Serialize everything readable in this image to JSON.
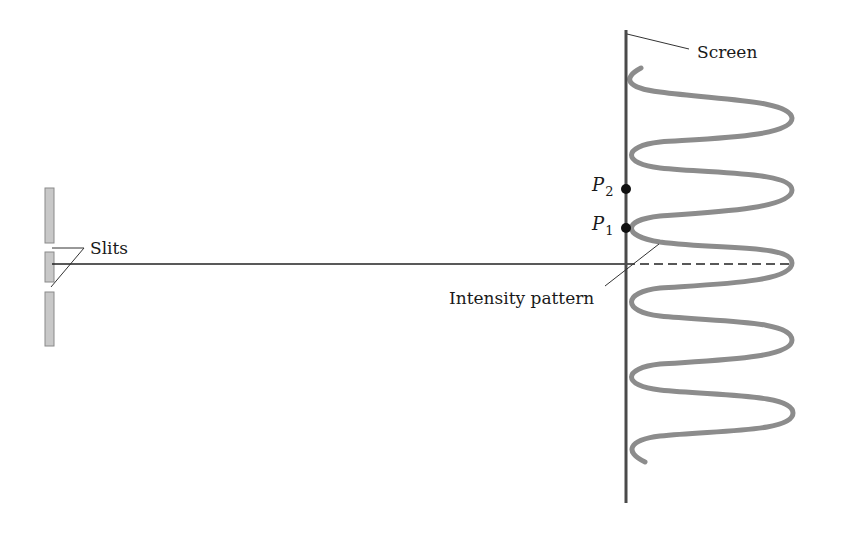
{
  "diagram": {
    "labels": {
      "screen": "Screen",
      "slits": "Slits",
      "intensity_pattern": "Intensity pattern",
      "p2_letter": "P",
      "p2_sub": "2",
      "p1_letter": "P",
      "p1_sub": "1"
    },
    "colors": {
      "screen": "#4a4a4a",
      "wave": "#8c8c8c",
      "slit_fill": "#c8c8c8",
      "slit_stroke": "#8a8a8a",
      "line": "#222222",
      "dot": "#111111"
    }
  }
}
